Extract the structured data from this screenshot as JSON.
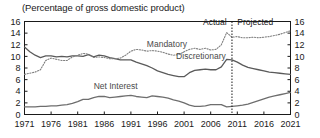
{
  "chart_data": {
    "type": "line",
    "title": "(Percentage of gross domestic product)",
    "xlabel": "",
    "ylabel": "",
    "xlim": [
      1971,
      2021
    ],
    "ylim": [
      0,
      16
    ],
    "yticks": [
      0,
      2,
      4,
      6,
      8,
      10,
      12,
      14,
      16
    ],
    "xticks": [
      1971,
      1976,
      1981,
      1986,
      1991,
      1996,
      2001,
      2006,
      2011,
      2016,
      2021
    ],
    "grid": false,
    "legend": "inline-annotations",
    "dual_y_axis": true,
    "annotations": [
      {
        "text": "Actual",
        "x": 2009,
        "y": 15.4,
        "align": "right"
      },
      {
        "text": "Projected",
        "x": 2011,
        "y": 15.4,
        "align": "left"
      },
      {
        "text": "Mandatory",
        "x": 1994,
        "y": 11.6,
        "align": "left"
      },
      {
        "text": "Discretionary",
        "x": 1999.5,
        "y": 9.5,
        "align": "left"
      },
      {
        "text": "Net Interest",
        "x": 1984,
        "y": 4.4,
        "align": "left"
      }
    ],
    "vertical_divider": {
      "x": 2010,
      "style": "dotted",
      "label_left": "Actual",
      "label_right": "Projected"
    },
    "series": [
      {
        "name": "Discretionary",
        "style": "solid",
        "color": "#5a5a5a",
        "x": [
          1971,
          1972,
          1973,
          1974,
          1975,
          1976,
          1977,
          1978,
          1979,
          1980,
          1981,
          1982,
          1983,
          1984,
          1985,
          1986,
          1987,
          1988,
          1989,
          1990,
          1991,
          1992,
          1993,
          1994,
          1995,
          1996,
          1997,
          1998,
          1999,
          2000,
          2001,
          2002,
          2003,
          2004,
          2005,
          2006,
          2007,
          2008,
          2009,
          2010,
          2011,
          2012,
          2013,
          2014,
          2015,
          2016,
          2017,
          2018,
          2019,
          2020,
          2021
        ],
        "values": [
          11.6,
          10.8,
          10.2,
          9.8,
          10.1,
          10.1,
          9.9,
          10.0,
          9.9,
          10.1,
          10.1,
          10.0,
          10.3,
          9.9,
          10.2,
          10.1,
          9.8,
          9.6,
          9.4,
          9.4,
          9.4,
          9.0,
          8.7,
          8.4,
          8.0,
          7.5,
          7.2,
          6.9,
          6.7,
          6.5,
          6.5,
          7.2,
          7.6,
          7.7,
          7.8,
          7.7,
          7.7,
          8.2,
          9.5,
          9.4,
          9.0,
          8.5,
          8.1,
          7.9,
          7.7,
          7.5,
          7.3,
          7.2,
          7.1,
          7.0,
          6.9
        ]
      },
      {
        "name": "Mandatory",
        "style": "dotted",
        "color": "#808080",
        "x": [
          1971,
          1972,
          1973,
          1974,
          1975,
          1976,
          1977,
          1978,
          1979,
          1980,
          1981,
          1982,
          1983,
          1984,
          1985,
          1986,
          1987,
          1988,
          1989,
          1990,
          1991,
          1992,
          1993,
          1994,
          1995,
          1996,
          1997,
          1998,
          1999,
          2000,
          2001,
          2002,
          2003,
          2004,
          2005,
          2006,
          2007,
          2008,
          2009,
          2010,
          2011,
          2012,
          2013,
          2014,
          2015,
          2016,
          2017,
          2018,
          2019,
          2020,
          2021
        ],
        "values": [
          6.9,
          7.1,
          7.3,
          7.7,
          9.3,
          9.7,
          9.5,
          9.3,
          9.3,
          9.9,
          10.2,
          10.5,
          10.4,
          9.8,
          9.9,
          9.8,
          9.6,
          9.6,
          9.7,
          10.2,
          10.9,
          11.2,
          11.1,
          10.9,
          11.0,
          10.9,
          10.7,
          10.4,
          10.2,
          10.3,
          10.8,
          11.2,
          11.4,
          11.2,
          11.4,
          11.1,
          11.2,
          12.0,
          14.1,
          13.3,
          13.4,
          13.2,
          13.2,
          13.3,
          13.2,
          13.3,
          13.4,
          13.6,
          13.8,
          14.1,
          14.4
        ]
      },
      {
        "name": "Net Interest",
        "style": "solid",
        "color": "#6e6e6e",
        "x": [
          1971,
          1972,
          1973,
          1974,
          1975,
          1976,
          1977,
          1978,
          1979,
          1980,
          1981,
          1982,
          1983,
          1984,
          1985,
          1986,
          1987,
          1988,
          1989,
          1990,
          1991,
          1992,
          1993,
          1994,
          1995,
          1996,
          1997,
          1998,
          1999,
          2000,
          2001,
          2002,
          2003,
          2004,
          2005,
          2006,
          2007,
          2008,
          2009,
          2010,
          2011,
          2012,
          2013,
          2014,
          2015,
          2016,
          2017,
          2018,
          2019,
          2020,
          2021
        ],
        "values": [
          1.3,
          1.3,
          1.3,
          1.4,
          1.4,
          1.5,
          1.5,
          1.6,
          1.7,
          1.9,
          2.2,
          2.6,
          2.6,
          2.9,
          3.1,
          3.1,
          2.9,
          3.0,
          3.1,
          3.2,
          3.3,
          3.1,
          3.0,
          2.9,
          3.2,
          3.1,
          3.0,
          2.8,
          2.5,
          2.3,
          2.0,
          1.6,
          1.4,
          1.4,
          1.5,
          1.7,
          1.7,
          1.7,
          1.3,
          1.4,
          1.5,
          1.6,
          1.8,
          2.1,
          2.4,
          2.7,
          3.0,
          3.2,
          3.4,
          3.6,
          3.8
        ]
      }
    ]
  },
  "axes": {
    "left_ticks": [
      "16",
      "14",
      "12",
      "10",
      "8",
      "6",
      "4",
      "2",
      "0"
    ],
    "right_ticks": [
      "16",
      "14",
      "12",
      "10",
      "8",
      "6",
      "4",
      "2",
      "0"
    ],
    "bottom_ticks": [
      "1971",
      "1976",
      "1981",
      "1986",
      "1991",
      "1996",
      "2001",
      "2006",
      "2011",
      "2016",
      "2021"
    ]
  },
  "labels": {
    "title": "(Percentage of gross domestic product)",
    "mandatory": "Mandatory",
    "discretionary": "Discretionary",
    "net_interest": "Net Interest",
    "actual": "Actual",
    "projected": "Projected"
  },
  "colors": {
    "axis": "#1a1a1a",
    "discretionary": "#5a5a5a",
    "mandatory": "#808080",
    "net_interest": "#6e6e6e",
    "divider": "#1a1a1a",
    "background": "#ffffff"
  }
}
